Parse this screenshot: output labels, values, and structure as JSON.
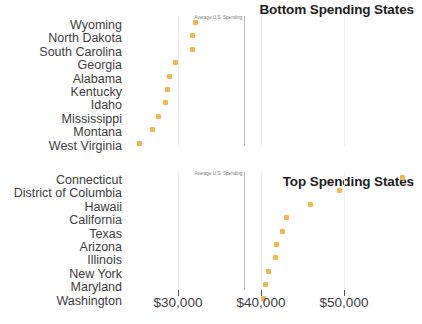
{
  "panels": [
    {
      "id": "bottom-spending",
      "title": "Bottom Spending States",
      "annotation": "Average U.S. Spending"
    },
    {
      "id": "top-spending",
      "title": "Top Spending States",
      "annotation": "Average U.S. Spending"
    }
  ],
  "axis": {
    "ticks": [
      {
        "value": 30000,
        "label": "$30,000"
      },
      {
        "value": 40000,
        "label": "$40,000"
      },
      {
        "value": 50000,
        "label": "$50,000"
      }
    ]
  },
  "chart_data": [
    {
      "type": "scatter",
      "title": "Bottom Spending States",
      "xlabel": "",
      "ylabel": "",
      "xlim": [
        24000,
        58000
      ],
      "grid": true,
      "legend": null,
      "annotations": [
        {
          "text": "Average U.S. Spending",
          "x": 38000,
          "type": "vline"
        }
      ],
      "categories": [
        "Wyoming",
        "North Dakota",
        "South Carolina",
        "Georgia",
        "Alabama",
        "Kentucky",
        "Idaho",
        "Mississippi",
        "Montana",
        "West Virginia"
      ],
      "values": [
        32050,
        31800,
        31700,
        29650,
        29000,
        28700,
        28450,
        27700,
        26900,
        25350
      ],
      "xticks": [
        30000,
        40000,
        50000
      ],
      "xticklabels": [
        "$30,000",
        "$40,000",
        "$50,000"
      ],
      "marker_color": "#f0b94f"
    },
    {
      "type": "scatter",
      "title": "Top Spending States",
      "xlabel": "",
      "ylabel": "",
      "xlim": [
        24000,
        58000
      ],
      "grid": true,
      "legend": null,
      "annotations": [
        {
          "text": "Average U.S. Spending",
          "x": 38000,
          "type": "vline"
        }
      ],
      "categories": [
        "Connecticut",
        "District of Columbia",
        "Hawaii",
        "California",
        "Texas",
        "Arizona",
        "Illinois",
        "New York",
        "Maryland",
        "Washington"
      ],
      "values": [
        57100,
        49400,
        46000,
        43100,
        42650,
        41900,
        41700,
        40850,
        40500,
        40250
      ],
      "xticks": [
        30000,
        40000,
        50000
      ],
      "xticklabels": [
        "$30,000",
        "$40,000",
        "$50,000"
      ],
      "marker_color": "#f0b94f"
    }
  ],
  "colors": {
    "marker": "#f0b94f",
    "avg_line": "#b9b9b9",
    "gridline": "#efefef",
    "title": "#1d1d1d",
    "text": "#3d3d3d"
  }
}
